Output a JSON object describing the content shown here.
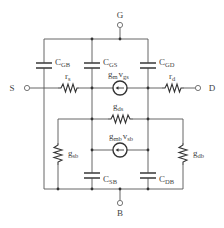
{
  "diagram": {
    "type": "MOSFET small-signal equivalent circuit",
    "terminals": {
      "gate": "G",
      "source": "S",
      "drain": "D",
      "body": "B"
    },
    "components": {
      "c_gb": {
        "main": "C",
        "sub": "GB"
      },
      "c_gs": {
        "main": "C",
        "sub": "GS"
      },
      "c_gd": {
        "main": "C",
        "sub": "GD"
      },
      "r_s": {
        "main": "r",
        "sub": "s"
      },
      "r_d": {
        "main": "r",
        "sub": "d"
      },
      "gm_vgs": {
        "main1": "g",
        "sub1": "m",
        "main2": "v",
        "sub2": "gs"
      },
      "g_ds": {
        "main": "g",
        "sub": "ds"
      },
      "gmb_vsb": {
        "main1": "g",
        "sub1": "mb",
        "main2": "v",
        "sub2": "sb"
      },
      "g_sb": {
        "main": "g",
        "sub": "sb"
      },
      "g_db": {
        "main": "g",
        "sub": "db"
      },
      "c_sb": {
        "main": "C",
        "sub": "SB"
      },
      "c_db": {
        "main": "C",
        "sub": "DB"
      }
    },
    "colors": {
      "wire": "#555555",
      "component": "#333333",
      "text": "#444444",
      "background": "#ffffff"
    }
  }
}
